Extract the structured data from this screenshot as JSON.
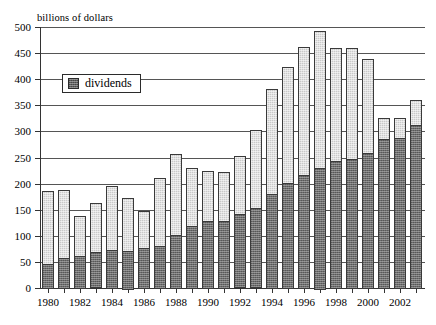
{
  "chart_data": {
    "type": "bar",
    "stacked": true,
    "title": "",
    "subtitle": "",
    "xlabel": "",
    "ylabel": "billions of dollars",
    "ylim": [
      0,
      500
    ],
    "ytick_step": 50,
    "ytick_labels": [
      "0",
      "50",
      "100",
      "150",
      "200",
      "250",
      "300",
      "350",
      "400",
      "450",
      "500"
    ],
    "grid": true,
    "grid_axis": "y",
    "legend_position": "upper-left-inside",
    "xtick_labels": [
      "1980",
      "1982",
      "1984",
      "1986",
      "1988",
      "1990",
      "1992",
      "1994",
      "1996",
      "1998",
      "2000",
      "2002"
    ],
    "categories": [
      "1980",
      "1981",
      "1982",
      "1983",
      "1984",
      "1985",
      "1986",
      "1987",
      "1988",
      "1989",
      "1990",
      "1991",
      "1992",
      "1993",
      "1994",
      "1995",
      "1996",
      "1997",
      "1998",
      "1999",
      "2000",
      "2001",
      "2002",
      "2003"
    ],
    "series": [
      {
        "name": "dividends",
        "color": "#6d6d6d",
        "values": [
          46,
          57,
          62,
          68,
          72,
          72,
          76,
          80,
          101,
          118,
          128,
          129,
          140,
          152,
          180,
          202,
          216,
          231,
          243,
          248,
          258,
          286,
          288,
          312
        ]
      },
      {
        "name": "other",
        "color": "#c9c9c9",
        "values": [
          140,
          131,
          76,
          94,
          123,
          101,
          71,
          130,
          156,
          112,
          96,
          94,
          112,
          150,
          202,
          222,
          245,
          262,
          217,
          212,
          180,
          40,
          38,
          48
        ]
      }
    ],
    "totals": [
      186,
      188,
      138,
      162,
      195,
      173,
      147,
      210,
      257,
      230,
      224,
      223,
      252,
      302,
      382,
      424,
      461,
      493,
      460,
      460,
      438,
      326,
      326,
      360
    ]
  },
  "legend": {
    "label": "dividends",
    "swatch_icon": "legend-swatch-icon"
  },
  "axes": {
    "y_axis_title": "billions of dollars"
  }
}
